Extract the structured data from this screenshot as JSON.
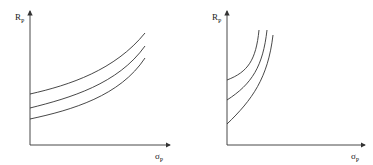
{
  "figure": {
    "panels": [
      {
        "id": "left",
        "y_label": "R",
        "y_label_sub": "P",
        "x_label": "σ",
        "x_label_sub": "P",
        "curves": 3,
        "description": "Three parallel upward-sloping, gently convex indifference curves"
      },
      {
        "id": "right",
        "y_label": "R",
        "y_label_sub": "P",
        "x_label": "σ",
        "x_label_sub": "P",
        "curves": 3,
        "description": "Three steep, strongly convex indifference curves"
      }
    ],
    "colors": {
      "line": "#333333",
      "background": "#ffffff"
    }
  }
}
